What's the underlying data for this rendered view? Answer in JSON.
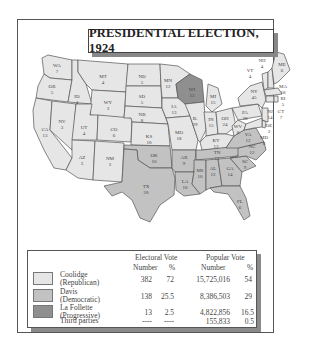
{
  "title": "PRESIDENTIAL ELECTION, 1924",
  "colors": {
    "republican": "#e6e6e6",
    "democratic": "#c2c2c2",
    "progressive": "#8f8f8f",
    "border": "#555555"
  },
  "map": {
    "states": [
      {
        "abbr": "WA",
        "ev": "7",
        "party": "republican"
      },
      {
        "abbr": "OR",
        "ev": "5",
        "party": "republican"
      },
      {
        "abbr": "CA",
        "ev": "13",
        "party": "republican"
      },
      {
        "abbr": "ID",
        "ev": "4",
        "party": "republican"
      },
      {
        "abbr": "NV",
        "ev": "3",
        "party": "republican"
      },
      {
        "abbr": "MT",
        "ev": "4",
        "party": "republican"
      },
      {
        "abbr": "WY",
        "ev": "3",
        "party": "republican"
      },
      {
        "abbr": "UT",
        "ev": "4",
        "party": "republican"
      },
      {
        "abbr": "CO",
        "ev": "6",
        "party": "republican"
      },
      {
        "abbr": "AZ",
        "ev": "3",
        "party": "republican"
      },
      {
        "abbr": "NM",
        "ev": "3",
        "party": "republican"
      },
      {
        "abbr": "ND",
        "ev": "5",
        "party": "republican"
      },
      {
        "abbr": "SD",
        "ev": "5",
        "party": "republican"
      },
      {
        "abbr": "NB",
        "ev": "8",
        "party": "republican"
      },
      {
        "abbr": "KS",
        "ev": "10",
        "party": "republican"
      },
      {
        "abbr": "OK",
        "ev": "10",
        "party": "democratic"
      },
      {
        "abbr": "TX",
        "ev": "20",
        "party": "democratic"
      },
      {
        "abbr": "MN",
        "ev": "12",
        "party": "republican"
      },
      {
        "abbr": "IA",
        "ev": "13",
        "party": "republican"
      },
      {
        "abbr": "MO",
        "ev": "18",
        "party": "republican"
      },
      {
        "abbr": "AR",
        "ev": "9",
        "party": "democratic"
      },
      {
        "abbr": "LA",
        "ev": "10",
        "party": "democratic"
      },
      {
        "abbr": "WI",
        "ev": "13",
        "party": "progressive"
      },
      {
        "abbr": "IL",
        "ev": "29",
        "party": "republican"
      },
      {
        "abbr": "MI",
        "ev": "15",
        "party": "republican"
      },
      {
        "abbr": "IN",
        "ev": "15",
        "party": "republican"
      },
      {
        "abbr": "OH",
        "ev": "24",
        "party": "republican"
      },
      {
        "abbr": "KY",
        "ev": "13",
        "party": "republican"
      },
      {
        "abbr": "TN",
        "ev": "12",
        "party": "democratic"
      },
      {
        "abbr": "MS",
        "ev": "10",
        "party": "democratic"
      },
      {
        "abbr": "AL",
        "ev": "12",
        "party": "democratic"
      },
      {
        "abbr": "GA",
        "ev": "14",
        "party": "democratic"
      },
      {
        "abbr": "FL",
        "ev": "6",
        "party": "democratic"
      },
      {
        "abbr": "SC",
        "ev": "9",
        "party": "democratic"
      },
      {
        "abbr": "NC",
        "ev": "12",
        "party": "democratic"
      },
      {
        "abbr": "VA",
        "ev": "12",
        "party": "democratic"
      },
      {
        "abbr": "WV",
        "ev": "8",
        "party": "republican"
      },
      {
        "abbr": "PA",
        "ev": "38",
        "party": "republican"
      },
      {
        "abbr": "NY",
        "ev": "45",
        "party": "republican"
      },
      {
        "abbr": "VT",
        "ev": "4",
        "party": "republican"
      },
      {
        "abbr": "NH",
        "ev": "4",
        "party": "republican"
      },
      {
        "abbr": "ME",
        "ev": "6",
        "party": "republican"
      },
      {
        "abbr": "MA",
        "ev": "18",
        "party": "republican"
      },
      {
        "abbr": "RI",
        "ev": "5",
        "party": "republican"
      },
      {
        "abbr": "CT",
        "ev": "7",
        "party": "republican"
      },
      {
        "abbr": "NJ",
        "ev": "14",
        "party": "republican"
      },
      {
        "abbr": "DE",
        "ev": "3",
        "party": "republican"
      },
      {
        "abbr": "MD",
        "ev": "8",
        "party": "republican"
      }
    ]
  },
  "legend": {
    "headers": {
      "electoral": "Electoral Vote",
      "popular": "Popular Vote",
      "number": "Number",
      "percent": "%"
    },
    "rows": [
      {
        "name": "Coolidge",
        "party": "(Republican)",
        "ev_number": "382",
        "ev_pct": "72",
        "pv_number": "15,725,016",
        "pv_pct": "54",
        "swatch": "republican"
      },
      {
        "name": "Davis",
        "party": "(Democratic)",
        "ev_number": "138",
        "ev_pct": "25.5",
        "pv_number": "8,386,503",
        "pv_pct": "29",
        "swatch": "democratic"
      },
      {
        "name": "La Follette",
        "party": "(Progressive)",
        "ev_number": "13",
        "ev_pct": "2.5",
        "pv_number": "4,822,856",
        "pv_pct": "16.5",
        "swatch": "progressive"
      },
      {
        "name": "Third parties",
        "party": "",
        "ev_number": "----",
        "ev_pct": "----",
        "pv_number": "155,833",
        "pv_pct": "0.5",
        "swatch": ""
      }
    ]
  }
}
